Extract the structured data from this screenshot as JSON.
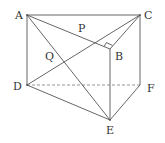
{
  "diagram": {
    "type": "triangular-prism",
    "points": {
      "A": {
        "x": 27,
        "y": 15,
        "label": "A",
        "lx": 15,
        "ly": 19
      },
      "C": {
        "x": 140,
        "y": 15,
        "label": "C",
        "lx": 144,
        "ly": 19
      },
      "B": {
        "x": 110,
        "y": 49,
        "label": "B",
        "lx": 115,
        "ly": 60
      },
      "D": {
        "x": 27,
        "y": 85,
        "label": "D",
        "lx": 13,
        "ly": 90
      },
      "F": {
        "x": 140,
        "y": 85,
        "label": "F",
        "lx": 147,
        "ly": 92
      },
      "E": {
        "x": 110,
        "y": 120,
        "label": "E",
        "lx": 106,
        "ly": 134
      },
      "P": {
        "x": 82,
        "y": 37,
        "label": "P",
        "lx": 78,
        "ly": 32
      },
      "Q": {
        "x": 59,
        "y": 57,
        "label": "Q",
        "lx": 45,
        "ly": 60
      }
    },
    "solid_edges": [
      "AC",
      "AB",
      "BC",
      "AD",
      "CF",
      "BE",
      "DE",
      "EF",
      "AE",
      "CD"
    ],
    "dashed_edges": [
      "DF"
    ],
    "right_angle_at": "B",
    "labels": {
      "A": "A",
      "B": "B",
      "C": "C",
      "D": "D",
      "E": "E",
      "F": "F",
      "P": "P",
      "Q": "Q"
    }
  }
}
